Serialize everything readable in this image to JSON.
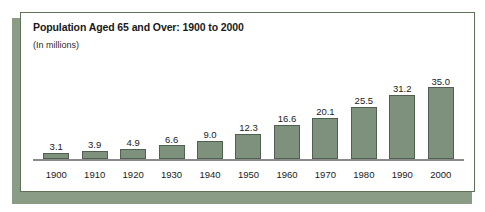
{
  "chart_data": {
    "type": "bar",
    "title": "Population Aged 65 and Over: 1900 to 2000",
    "subtitle": "(In millions)",
    "xlabel": "",
    "ylabel": "",
    "categories": [
      "1900",
      "1910",
      "1920",
      "1930",
      "1940",
      "1950",
      "1960",
      "1970",
      "1980",
      "1990",
      "2000"
    ],
    "values": [
      3.1,
      3.9,
      4.9,
      6.6,
      9.0,
      12.3,
      16.6,
      20.1,
      25.5,
      31.2,
      35.0
    ],
    "value_labels": [
      "3.1",
      "3.9",
      "4.9",
      "6.6",
      "9.0",
      "12.3",
      "16.6",
      "20.1",
      "25.5",
      "31.2",
      "35.0"
    ],
    "ylim": [
      0,
      35.0
    ],
    "grid": false,
    "legend": false,
    "bar_color": "#7d917d",
    "bar_border_color": "#4f6050",
    "axis_color": "#8a8a8a",
    "panel_border_color": "#5f7258",
    "shadow_color": "#8a9c86",
    "background": "#ffffff"
  }
}
